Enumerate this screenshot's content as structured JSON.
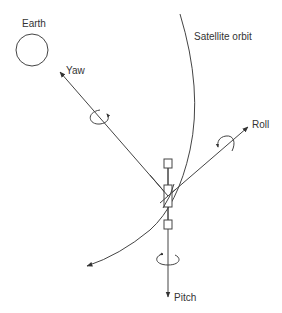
{
  "diagram": {
    "type": "satellite-attitude-axes",
    "labels": {
      "earth": "Earth",
      "orbit": "Satellite orbit",
      "yaw": "Yaw",
      "roll": "Roll",
      "pitch": "Pitch"
    },
    "nodes": [
      {
        "id": "earth",
        "shape": "circle",
        "label": "Earth"
      },
      {
        "id": "satellite",
        "shape": "rectangle-with-two-small-boxes"
      }
    ],
    "axes": [
      {
        "id": "yaw",
        "label": "Yaw",
        "direction": "up-left",
        "has_rotation_arrow": true
      },
      {
        "id": "roll",
        "label": "Roll",
        "direction": "up-right",
        "has_rotation_arrow": true
      },
      {
        "id": "pitch",
        "label": "Pitch",
        "direction": "down",
        "has_rotation_arrow": true
      }
    ],
    "curves": [
      {
        "id": "orbit",
        "label": "Satellite orbit",
        "direction": "down-left arrow"
      }
    ],
    "colors": {
      "line": "#444444",
      "text": "#333333",
      "background": "#ffffff"
    }
  }
}
